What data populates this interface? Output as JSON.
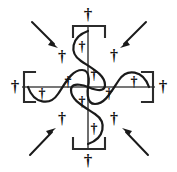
{
  "figure": {
    "canvas": {
      "width": 177,
      "height": 172
    },
    "background_color": "#ffffff",
    "center": {
      "x": 88,
      "y": 87
    }
  },
  "colors": {
    "axis": "#4a4a4a",
    "bracket": "#2b2b2b",
    "wave": "#1a1a1a",
    "arrow": "#1a1a1a",
    "dagger": "#111111",
    "background": "#ffffff"
  },
  "glyphs": {
    "dagger": "†"
  },
  "axes": {
    "horizontal": {
      "label": "horizontal-axis",
      "x1": 22,
      "x2": 155,
      "y": 87
    },
    "vertical": {
      "label": "vertical-axis",
      "y1": 25,
      "y2": 150,
      "x": 88
    }
  },
  "brackets": [
    {
      "name": "bracket-left",
      "orientation": "left",
      "x": 24,
      "y": 72,
      "width": 11,
      "height": 30
    },
    {
      "name": "bracket-right",
      "orientation": "right",
      "x": 142,
      "y": 72,
      "width": 11,
      "height": 30
    },
    {
      "name": "bracket-top",
      "orientation": "top",
      "x": 73,
      "y": 26,
      "width": 32,
      "height": 11
    },
    {
      "name": "bracket-bottom",
      "orientation": "bottom",
      "x": 73,
      "y": 138,
      "width": 32,
      "height": 11
    }
  ],
  "waves": [
    {
      "name": "wave-horizontal",
      "axis": "horizontal",
      "amplitude": 17,
      "span": 120
    },
    {
      "name": "wave-vertical",
      "axis": "vertical",
      "amplitude": 15,
      "span": 112
    }
  ],
  "arrows": [
    {
      "name": "arrow-top-left",
      "direction": "down-right",
      "x1": 32,
      "y1": 22,
      "x2": 57,
      "y2": 47
    },
    {
      "name": "arrow-top-right",
      "direction": "down-left",
      "x1": 146,
      "y1": 22,
      "x2": 121,
      "y2": 47
    },
    {
      "name": "arrow-bottom-left",
      "direction": "up-right",
      "x1": 30,
      "y1": 155,
      "x2": 55,
      "y2": 128
    },
    {
      "name": "arrow-bottom-right",
      "direction": "up-left",
      "x1": 148,
      "y1": 155,
      "x2": 123,
      "y2": 128
    }
  ],
  "daggers": [
    {
      "name": "dagger-top-outer",
      "symbol": "†",
      "x": 88,
      "y": 14,
      "size": 17
    },
    {
      "name": "dagger-bottom-outer",
      "symbol": "†",
      "x": 88,
      "y": 160,
      "size": 17
    },
    {
      "name": "dagger-left-outer",
      "symbol": "†",
      "x": 15,
      "y": 86,
      "size": 17
    },
    {
      "name": "dagger-right-outer",
      "symbol": "†",
      "x": 163,
      "y": 86,
      "size": 17
    },
    {
      "name": "dagger-quadrant-top-left",
      "symbol": "†",
      "x": 62,
      "y": 56,
      "size": 16
    },
    {
      "name": "dagger-quadrant-top-right",
      "symbol": "†",
      "x": 114,
      "y": 55,
      "size": 16
    },
    {
      "name": "dagger-quadrant-bottom-left",
      "symbol": "†",
      "x": 62,
      "y": 118,
      "size": 16
    },
    {
      "name": "dagger-quadrant-bottom-right",
      "symbol": "†",
      "x": 114,
      "y": 118,
      "size": 16
    },
    {
      "name": "dagger-wave-upper-inner",
      "symbol": "†",
      "x": 82,
      "y": 46,
      "size": 14
    },
    {
      "name": "dagger-wave-center-upper",
      "symbol": "†",
      "x": 94,
      "y": 74,
      "size": 14
    },
    {
      "name": "dagger-wave-center-lower",
      "symbol": "†",
      "x": 82,
      "y": 101,
      "size": 14
    },
    {
      "name": "dagger-wave-lower-inner",
      "symbol": "†",
      "x": 94,
      "y": 128,
      "size": 14
    },
    {
      "name": "dagger-wave-left-trough",
      "symbol": "†",
      "x": 42,
      "y": 93,
      "size": 14
    },
    {
      "name": "dagger-wave-left-crest",
      "symbol": "†",
      "x": 68,
      "y": 81,
      "size": 14
    },
    {
      "name": "dagger-wave-right-trough",
      "symbol": "†",
      "x": 109,
      "y": 93,
      "size": 14
    },
    {
      "name": "dagger-wave-right-crest",
      "symbol": "†",
      "x": 134,
      "y": 81,
      "size": 14
    }
  ]
}
